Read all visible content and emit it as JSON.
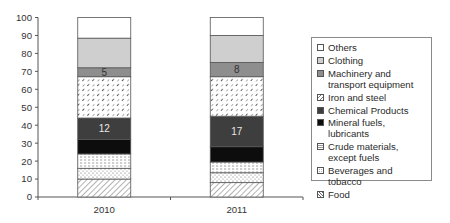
{
  "chart_data": {
    "type": "bar",
    "stacked": true,
    "title": "",
    "xlabel": "",
    "ylabel": "",
    "ylim": [
      0,
      100
    ],
    "yticks": [
      0,
      10,
      20,
      30,
      40,
      50,
      60,
      70,
      80,
      90,
      100
    ],
    "grid": false,
    "legend_position": "right",
    "categories": [
      "2010",
      "2011"
    ],
    "series": [
      {
        "name": "Food",
        "values": [
          10,
          8
        ],
        "fill": "hatch-diagonal",
        "color": "#ffffff"
      },
      {
        "name": "Beverages and tobacco",
        "values": [
          6,
          5.5
        ],
        "fill": "dots",
        "color": "#ffffff"
      },
      {
        "name": "Crude materials, except fuels",
        "values": [
          8,
          6
        ],
        "fill": "dashes",
        "color": "#ffffff"
      },
      {
        "name": "Mineral fuels, lubricants",
        "values": [
          8,
          8.5
        ],
        "fill": "solid",
        "color": "#0d0d0d"
      },
      {
        "name": "Chemical Products",
        "values": [
          12,
          17
        ],
        "fill": "solid",
        "color": "#3e3e3e"
      },
      {
        "name": "Iron and steel",
        "values": [
          23,
          22
        ],
        "fill": "dash-diagonal",
        "color": "#ffffff"
      },
      {
        "name": "Machinery and transport equipment",
        "values": [
          5,
          8
        ],
        "fill": "solid",
        "color": "#8e8e8e"
      },
      {
        "name": "Clothing",
        "values": [
          16.5,
          15
        ],
        "fill": "solid",
        "color": "#cfcfcf"
      },
      {
        "name": "Others",
        "values": [
          11.5,
          10
        ],
        "fill": "solid",
        "color": "#ffffff"
      }
    ],
    "data_labels": [
      {
        "category": "2010",
        "series": "Machinery and transport equipment",
        "text": "5"
      },
      {
        "category": "2010",
        "series": "Chemical Products",
        "text": "12"
      },
      {
        "category": "2011",
        "series": "Machinery and transport equipment",
        "text": "8"
      },
      {
        "category": "2011",
        "series": "Chemical Products",
        "text": "17"
      }
    ]
  },
  "legend": {
    "items": [
      {
        "label": "Others",
        "series": "Others"
      },
      {
        "label": "Clothing",
        "series": "Clothing"
      },
      {
        "label": "Machinery and transport equipment",
        "series": "Machinery and transport equipment"
      },
      {
        "label": "Iron and steel",
        "series": "Iron and steel"
      },
      {
        "label": "Chemical Products",
        "series": "Chemical Products"
      },
      {
        "label": "Mineral fuels, lubricants",
        "series": "Mineral fuels, lubricants"
      },
      {
        "label": "Crude materials, except fuels",
        "series": "Crude materials, except fuels"
      },
      {
        "label": "Beverages and tobacco",
        "series": "Beverages and tobacco"
      },
      {
        "label": "Food",
        "series": "Food"
      }
    ]
  }
}
